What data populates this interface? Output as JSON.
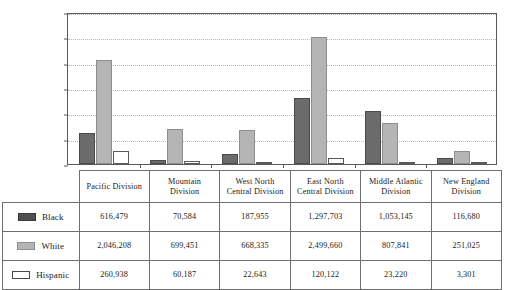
{
  "chart_data": {
    "type": "bar",
    "title": "",
    "xlabel": "",
    "ylabel": "",
    "ylim": [
      0,
      3000000
    ],
    "grid": true,
    "legend_position": "table-left",
    "categories": [
      "Pacific Division",
      "Mountain Division",
      "West North Central Division",
      "East North Central Division",
      "Middle Atlantic Division",
      "New England Division"
    ],
    "ytick_labels": [
      "3,000,000",
      "2,500,000",
      "2,000,000",
      "1,500,000",
      "1,000,000",
      "500, 000",
      "0"
    ],
    "ytick_values": [
      3000000,
      2500000,
      2000000,
      1500000,
      1000000,
      500000,
      0
    ],
    "series": [
      {
        "name": "Black",
        "color": "#6b6b6b",
        "values": [
          616479,
          70584,
          187955,
          1297703,
          1053145,
          116680
        ],
        "labels": [
          "616,479",
          "70,584",
          "187,955",
          "1,297,703",
          "1,053,145",
          "116,680"
        ]
      },
      {
        "name": "White",
        "color": "#b5b5b5",
        "values": [
          2046208,
          699451,
          668335,
          2499660,
          807841,
          251025
        ],
        "labels": [
          "2,046,208",
          "699,451",
          "668,335",
          "2,499,660",
          "807,841",
          "251,025"
        ]
      },
      {
        "name": "Hispanic",
        "color": "#ffffff",
        "values": [
          260938,
          60187,
          22643,
          120122,
          23220,
          3301
        ],
        "labels": [
          "260,938",
          "60,187",
          "22,643",
          "120,122",
          "23,220",
          "3,301"
        ]
      }
    ]
  },
  "table": {
    "corner_label": "",
    "headers": [
      [
        "Pacific Division"
      ],
      [
        "Mountain",
        "Division"
      ],
      [
        "West North",
        "Central Division"
      ],
      [
        "East North",
        "Central Division"
      ],
      [
        "Middle Atlantic",
        "Division"
      ],
      [
        "New England",
        "Division"
      ]
    ],
    "rows": [
      {
        "label": "Black",
        "swatch": "black-swatch",
        "cells": [
          "616,479",
          "70,584",
          "187,955",
          "1,297,703",
          "1,053,145",
          "116,680"
        ]
      },
      {
        "label": "White",
        "swatch": "white-swatch",
        "cells": [
          "2,046,208",
          "699,451",
          "668,335",
          "2,499,660",
          "807,841",
          "251,025"
        ]
      },
      {
        "label": "Hispanic",
        "swatch": "hispanic-swatch",
        "cells": [
          "260,938",
          "60,187",
          "22,643",
          "120,122",
          "23,220",
          "3,301"
        ]
      }
    ]
  },
  "colors": {
    "black_series": "#6b6b6b",
    "white_series": "#b5b5b5",
    "hispanic_series": "#ffffff",
    "axis": "#5a5a5a",
    "grid": "#b9b9b9"
  }
}
